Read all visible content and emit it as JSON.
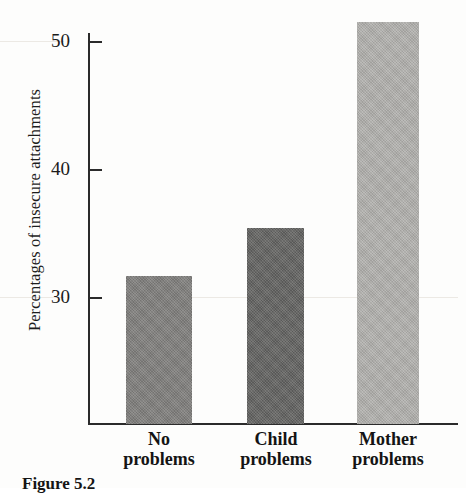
{
  "figure": {
    "caption": "Figure 5.2"
  },
  "chart_data": {
    "type": "bar",
    "title": "",
    "xlabel": "",
    "ylabel": "Percentages of insecure attachments",
    "categories": [
      "No problems",
      "Child problems",
      "Mother problems"
    ],
    "category_lines": [
      [
        "No",
        "problems"
      ],
      [
        "Child",
        "problems"
      ],
      [
        "Mother",
        "problems"
      ]
    ],
    "values": [
      31.7,
      35.5,
      51.6
    ],
    "bar_colors": [
      "#807f7d",
      "#636361",
      "#b2b1ae"
    ],
    "ylim": [
      22.8,
      53.0
    ],
    "yticks": [
      30,
      40,
      50
    ],
    "ytick_labels": [
      "30",
      "40",
      "50"
    ],
    "grid": false,
    "legend": "none"
  }
}
